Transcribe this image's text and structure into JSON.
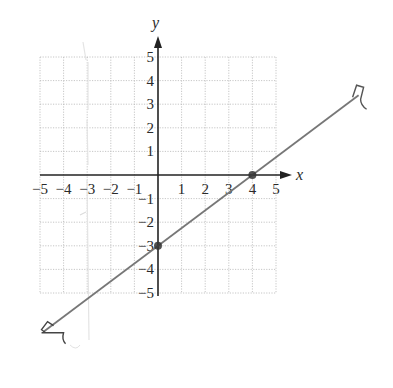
{
  "chart_data": {
    "type": "line",
    "title": "",
    "xlabel": "x",
    "ylabel": "y",
    "xlim": [
      -5,
      5
    ],
    "ylim": [
      -5,
      5
    ],
    "grid": true,
    "x_ticks": [
      "−5",
      "−4",
      "−3",
      "−2",
      "−1",
      "1",
      "2",
      "3",
      "4",
      "5"
    ],
    "y_ticks": [
      "5",
      "4",
      "3",
      "2",
      "1",
      "−1",
      "−2",
      "−3",
      "−4",
      "−5"
    ],
    "series": [
      {
        "name": "line",
        "equation": "y = 3/4 x − 3",
        "slope": 0.75,
        "intercept": -3,
        "x": [
          -4.85,
          8.5
        ],
        "y": [
          -6.64,
          3.38
        ],
        "arrows": "both",
        "color": "#777777"
      }
    ],
    "points": [
      {
        "label": "y-intercept",
        "x": 0,
        "y": -3
      },
      {
        "label": "x-intercept",
        "x": 4,
        "y": 0
      }
    ],
    "legend": null
  },
  "colors": {
    "axis": "#222222",
    "grid": "#b8b8b8",
    "line": "#777777",
    "point": "#333333"
  }
}
